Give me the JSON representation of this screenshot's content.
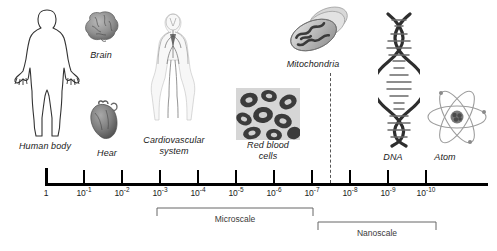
{
  "figure": {
    "axis": {
      "unit_note": "",
      "ticks": [
        {
          "id": "t1",
          "label": "1",
          "exponent": "",
          "x": 55
        },
        {
          "id": "t1e-1",
          "label": "10",
          "exponent": "-1",
          "x": 92
        },
        {
          "id": "t1e-2",
          "label": "10",
          "exponent": "-2",
          "x": 130
        },
        {
          "id": "t1e-3",
          "label": "10",
          "exponent": "-3",
          "x": 168
        },
        {
          "id": "t1e-4",
          "label": "10",
          "exponent": "-4",
          "x": 206
        },
        {
          "id": "t1e-5",
          "label": "10",
          "exponent": "-5",
          "x": 244
        },
        {
          "id": "t1e-6",
          "label": "10",
          "exponent": "-6",
          "x": 282
        },
        {
          "id": "t1e-7",
          "label": "10",
          "exponent": "-7",
          "x": 320
        },
        {
          "id": "t1e-8",
          "label": "10",
          "exponent": "-8",
          "x": 358
        },
        {
          "id": "t1e-9",
          "label": "10",
          "exponent": "-9",
          "x": 396
        },
        {
          "id": "t1e-10",
          "label": "10",
          "exponent": "-10",
          "x": 434
        }
      ],
      "line_start_x": 45,
      "line_end_x": 488,
      "line_y": 183
    },
    "ranges": [
      {
        "id": "microscale",
        "label": "Microscale",
        "start_x": 168,
        "end_x": 320,
        "bracket_y": 209,
        "label_y": 214
      },
      {
        "id": "nanoscale",
        "label": "Nanoscale",
        "start_x": 320,
        "end_x": 434,
        "bracket_y": 223,
        "label_y": 228
      }
    ],
    "divider": {
      "x": 330,
      "top_y": 73,
      "bottom_y": 183
    },
    "items": [
      {
        "id": "human-body",
        "label": "Human body",
        "caption_x": 14,
        "caption_y": 141
      },
      {
        "id": "brain",
        "label": "Brain",
        "caption_x": 76,
        "caption_y": 50
      },
      {
        "id": "heart",
        "label": "Hear",
        "caption_x": 90,
        "caption_y": 148
      },
      {
        "id": "cardiovascular",
        "label": "Cardiovascular\nsystem",
        "caption_x": 141,
        "caption_y": 135
      },
      {
        "id": "red-blood-cells",
        "label": "Red blood\ncells",
        "caption_x": 240,
        "caption_y": 140
      },
      {
        "id": "mitochondria",
        "label": "Mitochondria",
        "caption_x": 278,
        "caption_y": 59
      },
      {
        "id": "dna",
        "label": "DNA",
        "caption_x": 376,
        "caption_y": 152
      },
      {
        "id": "atom",
        "label": "Atom",
        "caption_x": 428,
        "caption_y": 152
      }
    ],
    "colors": {
      "axis": "#000000",
      "text": "#1a1a1a",
      "bracket": "#555555",
      "background": "#ffffff"
    }
  }
}
